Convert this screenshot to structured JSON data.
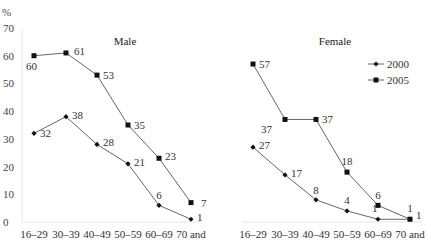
{
  "chart_data": {
    "type": "line",
    "y_unit_label": "%",
    "ylim": [
      0,
      70
    ],
    "yticks": [
      0,
      10,
      20,
      30,
      40,
      50,
      60,
      70
    ],
    "grid": false,
    "legend": {
      "placement": "top-right of Female panel",
      "entries": [
        "2000",
        "2005"
      ]
    },
    "categories": [
      "16–29",
      "30–39",
      "40–49",
      "50–59",
      "60–69",
      "70 and"
    ],
    "panels": [
      {
        "title": "Male",
        "series": [
          {
            "name": "2000",
            "marker": "diamond",
            "values": [
              32,
              38,
              28,
              21,
              6,
              1
            ]
          },
          {
            "name": "2005",
            "marker": "square",
            "values": [
              60,
              61,
              53,
              35,
              23,
              7
            ]
          }
        ]
      },
      {
        "title": "Female",
        "series": [
          {
            "name": "2000",
            "marker": "diamond",
            "values": [
              27,
              17,
              8,
              4,
              1,
              1
            ]
          },
          {
            "name": "2005",
            "marker": "square",
            "values": [
              57,
              37,
              37,
              18,
              6,
              1
            ]
          }
        ]
      }
    ]
  }
}
